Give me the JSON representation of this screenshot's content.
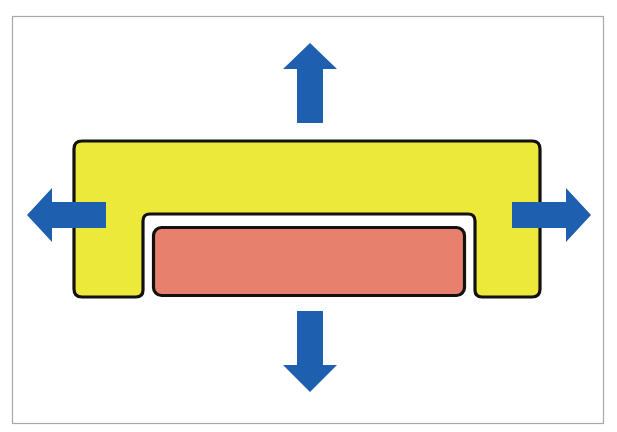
{
  "diagram": {
    "colors": {
      "background": "#ffffff",
      "frame": "#a8a8a8",
      "outer_part": "#ede93a",
      "inner_block": "#e8806e",
      "outline": "#111111",
      "gap": "#ffffff",
      "arrow": "#1e5faf"
    },
    "elements": {
      "outer_part": {
        "label": "yellow U-shaped part"
      },
      "inner_block": {
        "label": "red inner block"
      },
      "arrows": [
        {
          "direction": "up"
        },
        {
          "direction": "down"
        },
        {
          "direction": "left"
        },
        {
          "direction": "right"
        }
      ]
    }
  }
}
